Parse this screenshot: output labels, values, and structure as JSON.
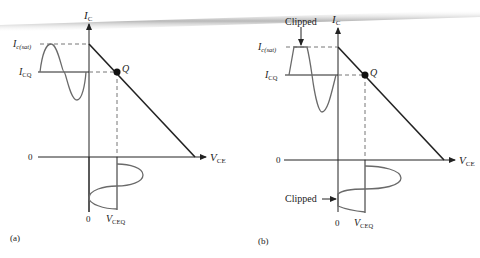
{
  "figure": {
    "panels": [
      {
        "id": "a",
        "caption": "(a)",
        "y_axis_label": "I",
        "y_axis_sub": "C",
        "x_axis_label": "V",
        "x_axis_sub": "CE",
        "ic_sat_label": "I",
        "ic_sat_sub": "c(sat)",
        "icq_label": "I",
        "icq_sub": "CQ",
        "q_label": "Q",
        "zero_h": "0",
        "zero_v": "0",
        "vceq_label": "V",
        "vceq_sub": "CEQ"
      },
      {
        "id": "b",
        "caption": "(b)",
        "y_axis_label": "I",
        "y_axis_sub": "C",
        "x_axis_label": "V",
        "x_axis_sub": "CE",
        "ic_sat_label": "I",
        "ic_sat_sub": "c(sat)",
        "icq_label": "I",
        "icq_sub": "CQ",
        "q_label": "Q",
        "zero_h": "0",
        "zero_v": "0",
        "vceq_label": "V",
        "vceq_sub": "CEQ",
        "clipped_top_label": "Clipped",
        "clipped_bottom_label": "Clipped"
      }
    ],
    "colors": {
      "ink": "#222222",
      "waveform": "#6a6a6a",
      "dashed": "#777777",
      "page_shadow": "#bdbdbd"
    }
  }
}
